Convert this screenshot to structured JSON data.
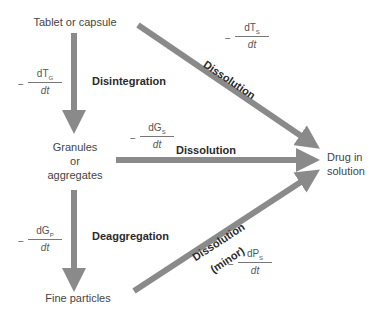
{
  "nodes": {
    "tablet": "Tablet or capsule",
    "granules_line1": "Granules",
    "granules_line2": "or",
    "granules_line3": "aggregates",
    "fine": "Fine particles",
    "drug_line1": "Drug in",
    "drug_line2": "solution"
  },
  "processes": {
    "disintegration": "Disintegration",
    "deaggregation": "Deaggregation",
    "dissolution_top": "Dissolution",
    "dissolution_mid": "Dissolution",
    "dissolution_bottom": "Dissolution",
    "dissolution_bottom_note": "(minor)"
  },
  "rates": {
    "tg": {
      "minus": "−",
      "num": "dT",
      "sub": "G",
      "den": "dt"
    },
    "ts": {
      "minus": "−",
      "num": "dT",
      "sub": "S",
      "den": "dt"
    },
    "gs": {
      "minus": "−",
      "num": "dG",
      "sub": "S",
      "den": "dt"
    },
    "gp": {
      "minus": "−",
      "num": "dG",
      "sub": "P",
      "den": "dt"
    },
    "ps": {
      "minus": "−",
      "num": "dP",
      "sub": "S",
      "den": "dt"
    }
  },
  "colors": {
    "arrow": "#8a8a8a",
    "text": "#444444"
  }
}
